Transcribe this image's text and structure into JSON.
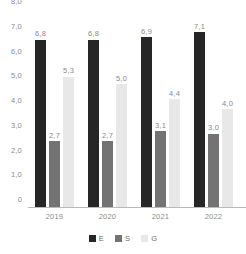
{
  "chart_data": {
    "type": "bar",
    "title": "",
    "subtitle": "",
    "xlabel": "",
    "ylabel": "",
    "categories": [
      "2019",
      "2020",
      "2021",
      "2022"
    ],
    "series": [
      {
        "name": "E",
        "color": "#262626",
        "values": [
          6.8,
          6.8,
          6.9,
          7.1
        ],
        "labels": [
          "6,8",
          "6,8",
          "6,9",
          "7,1"
        ]
      },
      {
        "name": "S",
        "color": "#737373",
        "values": [
          2.7,
          2.7,
          3.1,
          3.0
        ],
        "labels": [
          "2,7",
          "2,7",
          "3,1",
          "3,0"
        ]
      },
      {
        "name": "G",
        "color": "#e8e8e8",
        "values": [
          5.3,
          5.0,
          4.4,
          4.0
        ],
        "labels": [
          "5,3",
          "5,0",
          "4,4",
          "4,0"
        ]
      }
    ],
    "ylim": [
      0,
      8
    ],
    "ytick_values": [
      0,
      1,
      2,
      3,
      4,
      5,
      6,
      7,
      8
    ],
    "ytick_labels": [
      "0",
      "1,0",
      "2,0",
      "3,0",
      "4,0",
      "5,0",
      "6,0",
      "7,0",
      "8,0"
    ],
    "grid": false,
    "legend_position": "bottom",
    "data_labels": true,
    "axis_color": "#b9b9b9",
    "tick_text_color": "#8a8a8a",
    "background": "#ffffff"
  },
  "legend": {
    "items": [
      {
        "label": "E",
        "color": "#262626"
      },
      {
        "label": "S",
        "color": "#737373"
      },
      {
        "label": "G",
        "color": "#e8e8e8"
      }
    ]
  }
}
